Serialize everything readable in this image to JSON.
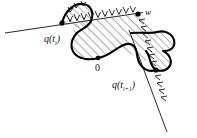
{
  "figure": {
    "domain": "Diagram",
    "kind": "mathematical-line-diagram",
    "background_color": "#ffffff",
    "stroke_color": "#000000",
    "hatch_color": "#333333",
    "width": 197,
    "height": 138
  },
  "labels": {
    "point_left": "q(t",
    "point_left_sub": "i",
    "point_left_close": ")",
    "point_left_full": "q(t_i)",
    "point_right": "q(t",
    "point_right_sub": "i+1",
    "point_right_close": ")",
    "point_right_full": "q(t_i+1)",
    "origin": "0",
    "vertex": "w"
  },
  "points": {
    "q_ti": {
      "x": 62,
      "y": 23,
      "label": "q(t_i)"
    },
    "w": {
      "x": 138,
      "y": 14,
      "label": "w"
    },
    "origin": {
      "x": 98,
      "y": 58,
      "label": "0"
    },
    "q_ti1": {
      "x": 156,
      "y": 70,
      "label": "q(t_i+1)"
    }
  },
  "label_positions": {
    "q_ti": {
      "x": 46,
      "y": 40
    },
    "w": {
      "x": 146,
      "y": 14
    },
    "origin": {
      "x": 96,
      "y": 70
    },
    "q_ti1": {
      "x": 117,
      "y": 86
    }
  },
  "elements": {
    "line_upper": {
      "name": "upper-straight-line",
      "from": {
        "x": 6,
        "y": 32
      },
      "to": {
        "x": 142,
        "y": 13
      }
    },
    "line_lower": {
      "name": "lower-straight-line",
      "from": {
        "x": 130,
        "y": 33
      },
      "to": {
        "x": 166,
        "y": 130
      }
    },
    "lobe_top_left": {
      "name": "top-left-lobe"
    },
    "lobe_right": {
      "name": "right-lobe"
    },
    "main_region": {
      "name": "main-hatched-region"
    }
  },
  "hatching": {
    "angle_deg": 45,
    "spacing_px": 6,
    "line_width": 0.7
  },
  "tick_marks": {
    "style": "arrow-barbs",
    "count_upper_edge": 14,
    "count_right_edge": 11
  }
}
